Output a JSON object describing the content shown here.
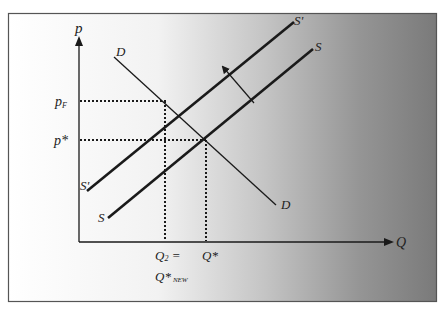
{
  "diagram": {
    "axes": {
      "y_label": "p",
      "x_label": "Q"
    },
    "curves": {
      "supply_new_label_top": "S'",
      "supply_new_label_bottom": "S'",
      "supply_label_top": "S",
      "supply_label_bottom": "S",
      "demand_label_top": "D",
      "demand_label_bottom": "D"
    },
    "price_labels": {
      "p_f_main": "p",
      "p_f_sub": "F",
      "p_star": "p*"
    },
    "quantity_labels": {
      "q2_line1_main": "Q",
      "q2_line1_sub": "2",
      "q2_line1_eq": " =",
      "q2_line2_main": "Q*",
      "q2_line2_sub": "NEW",
      "q_star": "Q*"
    },
    "colors": {
      "frame_border": "#555555",
      "gradient_left": "#ffffff",
      "gradient_mid": "#d8d8d8",
      "gradient_right": "#7a7a7a",
      "line": "#1a1a1a"
    }
  }
}
